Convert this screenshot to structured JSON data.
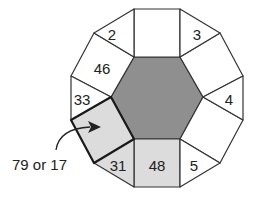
{
  "diagram": {
    "type": "dodecagon tiling with central hexagon",
    "colors": {
      "hexagon": "#8f8f8f",
      "shaded_square": "#dcdcdc",
      "white": "#ffffff",
      "stroke": "#333333"
    },
    "tiles": {
      "top_square": "",
      "top_left_triangle": "2",
      "top_right_triangle": "3",
      "upper_left_square": "46",
      "upper_right_square": "",
      "left_triangle": "33",
      "right_triangle": "4",
      "lower_left_square": "",
      "lower_right_square": "",
      "bottom_left_triangle": "31",
      "bottom_square": "48",
      "bottom_right_triangle": "5"
    },
    "callout": {
      "label": "79 or 17",
      "target": "lower_left_square"
    }
  }
}
